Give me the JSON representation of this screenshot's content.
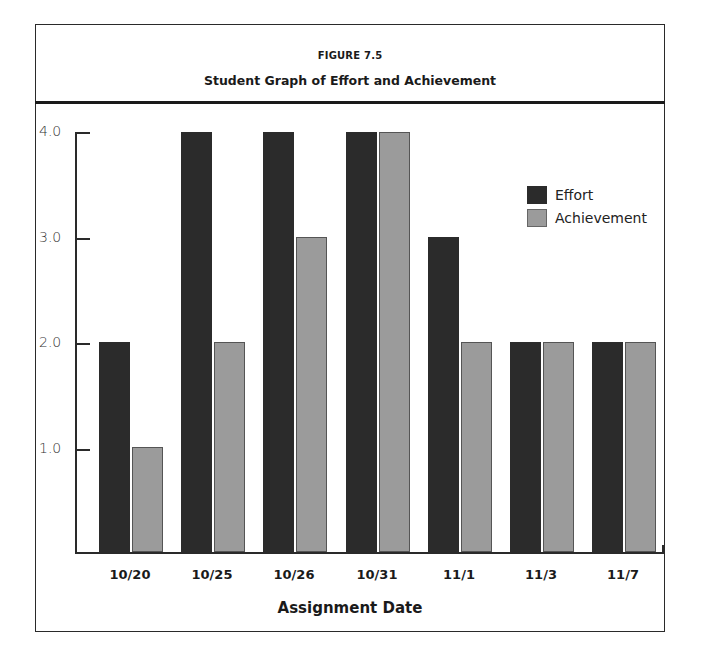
{
  "figure": {
    "number": "FIGURE 7.5",
    "title": "Student Graph of Effort and Achievement"
  },
  "legend": {
    "effort": "Effort",
    "achievement": "Achievement"
  },
  "axis": {
    "y_ticks": [
      "1.0",
      "2.0",
      "3.0",
      "4.0"
    ],
    "x_title": "Assignment Date",
    "x_labels": [
      "10/20",
      "10/25",
      "10/26",
      "10/31",
      "11/1",
      "11/3",
      "11/7"
    ]
  },
  "colors": {
    "effort": "#2b2b2b",
    "achievement": "#9b9b9b"
  },
  "chart_data": {
    "type": "bar",
    "title": "Student Graph of Effort and Achievement",
    "subtitle": "FIGURE 7.5",
    "xlabel": "Assignment Date",
    "ylabel": "",
    "categories": [
      "10/20",
      "10/25",
      "10/26",
      "10/31",
      "11/1",
      "11/3",
      "11/7"
    ],
    "series": [
      {
        "name": "Effort",
        "values": [
          2,
          4,
          4,
          4,
          3,
          2,
          2
        ]
      },
      {
        "name": "Achievement",
        "values": [
          1,
          2,
          3,
          4,
          2,
          2,
          2
        ]
      }
    ],
    "ylim": [
      0,
      4
    ],
    "y_ticks": [
      1.0,
      2.0,
      3.0,
      4.0
    ],
    "grid": false,
    "legend_position": "upper right"
  }
}
